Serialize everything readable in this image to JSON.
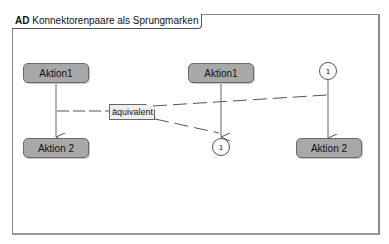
{
  "frame": {
    "kind": "AD",
    "title": "Konnektorenpaare als Sprungmarken"
  },
  "left_group": {
    "action_top": "Aktion1",
    "action_bottom": "Aktion 2"
  },
  "note": {
    "text": "äquivalent"
  },
  "middle_group": {
    "action": "Aktion1",
    "connector": "1"
  },
  "right_group": {
    "connector": "1",
    "action": "Aktion 2"
  },
  "colors": {
    "action_fill": "#a8a8a8",
    "action_border": "#6a6a6a",
    "note_fill": "#efefef",
    "line": "#555555"
  }
}
